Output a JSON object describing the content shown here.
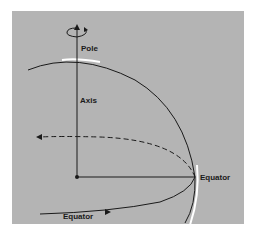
{
  "diagram": {
    "type": "earth-rotation-axis-diagram",
    "labels": {
      "pole": "Pole",
      "axis": "Axis",
      "equator_right": "Equator",
      "equator_bottom": "Equator"
    },
    "colors": {
      "background_panel": "#b4b4b4",
      "line": "#1a1a1a",
      "highlight": "#ffffff"
    }
  }
}
